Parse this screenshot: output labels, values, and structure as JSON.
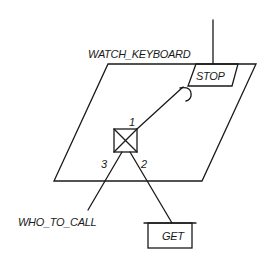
{
  "diagram": {
    "type": "task-interaction-diagram",
    "process": {
      "name": "WATCH_KEYBOARD",
      "shape": "parallelogram"
    },
    "entries": [
      {
        "name": "STOP",
        "shape": "parallelogram"
      }
    ],
    "select_node": {
      "symbol": "crossed-box",
      "branches": [
        {
          "number": "1",
          "target": "STOP"
        },
        {
          "number": "2",
          "target": "GET"
        },
        {
          "number": "3",
          "target": "WHO_TO_CALL"
        }
      ]
    },
    "external": [
      {
        "name": "GET",
        "shape": "rectangle-with-overbar"
      },
      {
        "name": "WHO_TO_CALL",
        "shape": "label"
      }
    ],
    "colors": {
      "line": "#1a1a1a",
      "background": "#ffffff"
    }
  }
}
